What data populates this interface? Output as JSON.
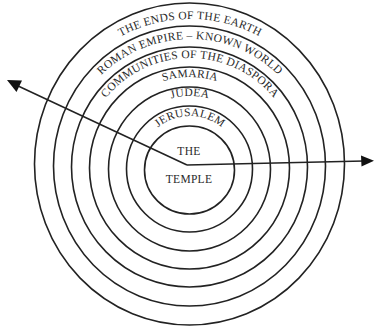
{
  "diagram": {
    "center_label": {
      "line1": "THE",
      "line2": "TEMPLE"
    },
    "rings": [
      {
        "label": "JERUSALEM"
      },
      {
        "label": "JUDEA"
      },
      {
        "label": "SAMARIA"
      },
      {
        "label": "COMMUNITIES OF THE DIASPORA"
      },
      {
        "label": "ROMAN EMPIRE – KNOWN WORLD"
      },
      {
        "label": "THE ENDS OF THE EARTH"
      }
    ],
    "arrows": [
      {
        "name": "arrow-to-left",
        "direction": "up-left"
      },
      {
        "name": "arrow-to-right",
        "direction": "right"
      }
    ],
    "colors": {
      "line": "#222222",
      "text": "#2a2a2a",
      "background": "#ffffff"
    }
  }
}
